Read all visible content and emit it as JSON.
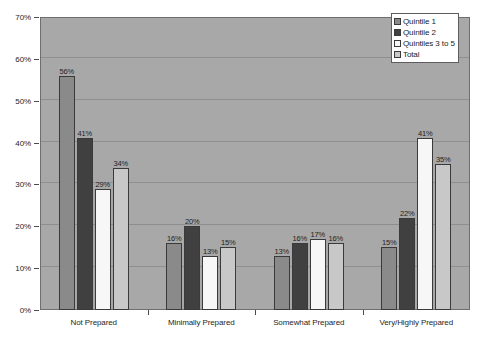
{
  "chart_data": {
    "type": "bar",
    "title": "",
    "subtitle": "",
    "xlabel": "",
    "ylabel": "",
    "ylim": [
      0,
      70
    ],
    "ytick_step": 10,
    "ytick_labels": [
      "0%",
      "10%",
      "20%",
      "30%",
      "40%",
      "50%",
      "60%",
      "70%"
    ],
    "ytick_values": [
      0,
      10,
      20,
      30,
      40,
      50,
      60,
      70
    ],
    "grid": true,
    "grid_axis": "y",
    "legend_position": "top-right",
    "value_suffix": "%",
    "categories": [
      "Not Prepared",
      "Minimally Prepared",
      "Somewhat Prepared",
      "Very/Highly Prepared"
    ],
    "series": [
      {
        "name": "Quintile 1",
        "color": "#8a8a8a",
        "values": [
          56,
          16,
          13,
          15
        ],
        "labels": [
          "56%",
          "16%",
          "13%",
          "15%"
        ]
      },
      {
        "name": "Quintile 2",
        "color": "#404040",
        "values": [
          41,
          20,
          16,
          22
        ],
        "labels": [
          "41%",
          "20%",
          "16%",
          "22%"
        ]
      },
      {
        "name": "Quintiles 3 to 5",
        "color": "#f7f7f7",
        "values": [
          29,
          13,
          17,
          41
        ],
        "labels": [
          "29%",
          "13%",
          "17%",
          "41%"
        ]
      },
      {
        "name": "Total",
        "color": "#c8c8c8",
        "values": [
          34,
          15,
          16,
          35
        ],
        "labels": [
          "34%",
          "15%",
          "16%",
          "35%"
        ]
      }
    ],
    "plot_background": "#a8a8a8",
    "page_background": "#ffffff",
    "gridline_color": "#8f8f8f",
    "bar_outline_color": "#3a3a3a"
  }
}
